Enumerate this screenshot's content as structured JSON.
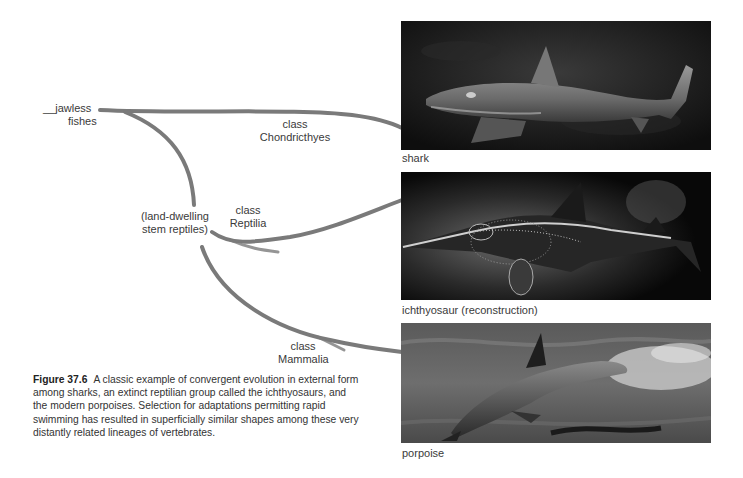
{
  "tree": {
    "root": {
      "dash": "__",
      "line1": "jawless",
      "line2": "fishes"
    },
    "branches": [
      {
        "line1": "class",
        "line2": "Chondricthyes"
      },
      {
        "line1": "(land-dwelling",
        "line2": "stem reptiles)"
      },
      {
        "line1": "class",
        "line2": "Reptilia"
      },
      {
        "line1": "class",
        "line2": "Mammalia"
      }
    ],
    "line_color": "#7a7a7a"
  },
  "photos": [
    {
      "label": "shark",
      "subject": "shark swimming in dark water"
    },
    {
      "label": "ichthyosaur (reconstruction)",
      "subject": "ichthyosaur fossil skeleton with body outline"
    },
    {
      "label": "porpoise",
      "subject": "porpoise leaping through water"
    }
  ],
  "caption": {
    "figure_label": "Figure 37.6",
    "text": "A classic example of convergent evolution in external form among sharks, an extinct reptilian group called the ichthyosaurs, and the modern porpoises. Selection for adaptations permitting rapid swimming has resulted in superficially similar shapes among these very distantly related lineages of vertebrates."
  }
}
